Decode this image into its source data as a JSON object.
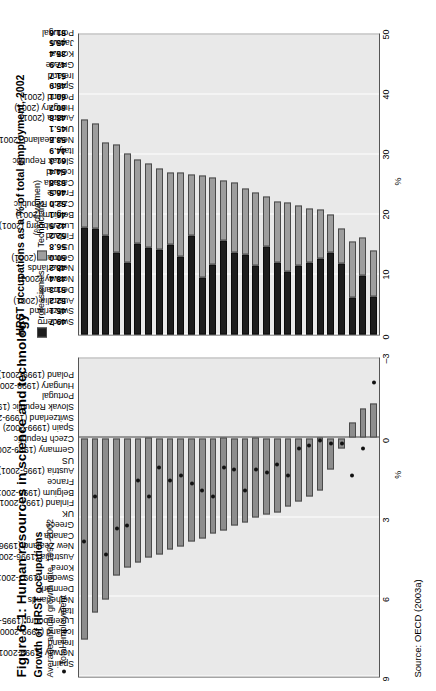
{
  "figure": {
    "title": "Figure 6.1: Human resources in science and technology",
    "source": "Source: OECD (2003a)"
  },
  "left_panel": {
    "title": "Growth of HRST occupations",
    "note": "Average annual growth rate, 1995-2002",
    "legend_label": "Total employment",
    "axis_label": "%"
  },
  "right_panel": {
    "title": "HRST occupations as a % of total employment, 2002",
    "pct_women_label": "(% of women)",
    "legend": [
      "Professionals",
      "Technicians"
    ],
    "axis_label": "%"
  },
  "chart_data": [
    {
      "type": "bar",
      "id": "growth-hrst",
      "title": "Growth of HRST occupations",
      "subtitle": "Average annual growth rate, 1995-2002",
      "xlabel": "",
      "ylabel": "%",
      "ylim": [
        -3,
        9
      ],
      "yticks": [
        9,
        6,
        3,
        0,
        -3
      ],
      "grid": true,
      "legend": [
        "Total employment"
      ],
      "categories": [
        "Spain",
        "Norway (1999-2001)",
        "Ireland",
        "Iceland (1999-2000)",
        "Luxembourg (1995-2001)",
        "Italy",
        "Netherlands",
        "Denmark",
        "Sweden (1997-2001)",
        "Korea",
        "Australia (1996-2001)",
        "New Zealand (1996-2001)",
        "Canada",
        "Greece",
        "UK",
        "Finland (1997-2001)",
        "Belgium (1995-2001)",
        "France",
        "Austria (1995-2001)",
        "US",
        "Germany (1999-2002)",
        "Czech Republic",
        "Spain (1999-2002)",
        "Switzerland (1999-2002)",
        "Slovak Republic (1999-2002)",
        "Portugal",
        "Hungary (1999-2001)",
        "Poland (1999-2001)"
      ],
      "series": [
        {
          "name": "HRST occupations",
          "values": [
            7.6,
            6.6,
            6.1,
            5.2,
            4.9,
            4.7,
            4.5,
            4.4,
            4.2,
            4.1,
            3.9,
            3.8,
            3.6,
            3.5,
            3.3,
            3.2,
            3.0,
            2.9,
            2.8,
            2.6,
            2.4,
            2.2,
            2.0,
            1.2,
            0.4,
            -0.6,
            -1.1,
            -1.3
          ]
        },
        {
          "name": "Total employment",
          "values": [
            3.9,
            2.2,
            4.4,
            3.4,
            3.3,
            1.6,
            2.2,
            1.1,
            1.6,
            1.4,
            1.7,
            2.0,
            2.2,
            1.1,
            1.2,
            2.0,
            1.2,
            1.3,
            1.0,
            1.4,
            0.4,
            0.3,
            0.1,
            0.2,
            0.2,
            1.4,
            0.4,
            -2.1
          ]
        }
      ]
    },
    {
      "type": "bar",
      "id": "hrst-share-2002",
      "stacked": true,
      "title": "HRST occupations as a % of total employment, 2002",
      "xlabel": "",
      "ylabel": "%",
      "ylim": [
        0,
        50
      ],
      "yticks": [
        0,
        10,
        20,
        30,
        40,
        50
      ],
      "grid": true,
      "legend": [
        "Professionals",
        "Technicians"
      ],
      "categories": [
        "Sweden",
        "Switzerland",
        "Australia (2001)",
        "Denmark",
        "Norway (2001)",
        "Netherlands",
        "Germany (2001)",
        "US",
        "Finland",
        "Luxembourg (2001)",
        "Belgium (2001)",
        "Czech Republic",
        "France",
        "Canada",
        "Iceland",
        "Slovak Republic",
        "Italy",
        "New Zealand (2001)",
        "UK",
        "Austria (2001)",
        "Hungary (2001)",
        "Poland (2001)",
        "Spain",
        "Ireland",
        "Greece",
        "Korea",
        "Japan",
        "Portugal"
      ],
      "series": [
        {
          "name": "Professionals",
          "values": [
            17.8,
            17.6,
            16.5,
            13.6,
            12.0,
            15.2,
            14.5,
            14.2,
            15.0,
            13.0,
            16.5,
            9.5,
            11.6,
            15.6,
            13.6,
            13.3,
            11.5,
            14.6,
            12.0,
            10.5,
            11.5,
            12.0,
            12.7,
            13.7,
            11.9,
            6.1,
            9.8,
            6.3
          ]
        },
        {
          "name": "Technicians",
          "values": [
            18.0,
            17.5,
            15.5,
            18.0,
            18.2,
            14.0,
            14.0,
            13.5,
            12.0,
            14.0,
            10.2,
            17.0,
            14.5,
            10.0,
            11.8,
            11.0,
            12.2,
            8.4,
            10.2,
            11.5,
            10.0,
            9.0,
            8.2,
            6.3,
            5.8,
            9.4,
            6.4,
            7.7
          ]
        }
      ],
      "pct_women": [
        49.7,
        45.1,
        52.2,
        51.3,
        48.4,
        48.2,
        50.0,
        56.8,
        52.2,
        42.5,
        46.1,
        52.0,
        46.5,
        53.8,
        54.4,
        61.3,
        44.9,
        53.6,
        45.1,
        48.8,
        60.7,
        60.1,
        45.9,
        51.7,
        47.9,
        35.4,
        45.5,
        51.6
      ],
      "pct_women_label": "(% of women)"
    }
  ],
  "colors": {
    "professionals": "#1d1d1d",
    "technicians": "#9e9e9e",
    "growth_bar": "#8d8d8d",
    "marker": "#111111",
    "plot_bg": "#e9e9e9"
  }
}
